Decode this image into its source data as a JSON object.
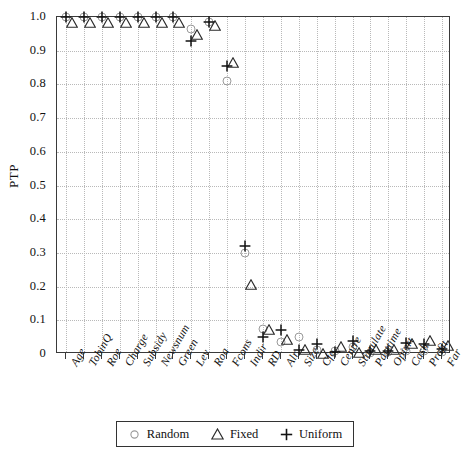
{
  "chart_data": {
    "type": "scatter",
    "title": "",
    "xlabel": "",
    "ylabel": "PTP",
    "ylim": [
      0,
      1.0
    ],
    "ytick_labels": [
      "1.0",
      "0.9",
      "0.8",
      "0.7",
      "0.6",
      "0.5",
      "0.4",
      "0.3",
      "0.2",
      "0.1",
      "0"
    ],
    "ytick_values": [
      1.0,
      0.9,
      0.8,
      0.7,
      0.6,
      0.5,
      0.4,
      0.3,
      0.2,
      0.1,
      0
    ],
    "grid": true,
    "legend_position": "below-axis",
    "categories": [
      "Age",
      "TobinQ",
      "Roe",
      "Charge",
      "Subsidy",
      "Newsnum",
      "Green",
      "Lev",
      "Roa",
      "Fcons",
      "Indir",
      "RD",
      "Alr",
      "Size",
      "Cfo",
      "Centre",
      "Stimulate",
      "Parttime",
      "Opicrt",
      "Cash",
      "Profit",
      "Far"
    ],
    "series": [
      {
        "name": "Random",
        "marker": "circle",
        "color": "#9a9a9a",
        "values": [
          1.0,
          1.0,
          1.0,
          1.0,
          1.0,
          1.0,
          1.0,
          0.965,
          0.985,
          0.81,
          0.3,
          0.075,
          0.035,
          0.05,
          0.012,
          0.008,
          0.02,
          0.004,
          0.006,
          0.01,
          0.008,
          0.005
        ]
      },
      {
        "name": "Fixed",
        "marker": "triangle",
        "color": "#2b2b2b",
        "values": [
          1.0,
          1.0,
          1.0,
          1.0,
          1.0,
          1.0,
          1.0,
          0.965,
          0.99,
          0.88,
          0.222,
          0.09,
          0.058,
          0.03,
          0.018,
          0.04,
          0.022,
          0.03,
          0.03,
          0.048,
          0.055,
          0.042
        ]
      },
      {
        "name": "Uniform",
        "marker": "plus",
        "color": "#111111",
        "values": [
          1.0,
          1.0,
          1.0,
          1.0,
          1.0,
          1.0,
          1.0,
          0.928,
          0.985,
          0.855,
          0.32,
          0.05,
          0.07,
          0.012,
          0.03,
          0.006,
          0.038,
          0.01,
          0.01,
          0.032,
          0.03,
          0.016
        ]
      }
    ]
  },
  "legend": {
    "items": [
      {
        "label": "Random",
        "symbol": "circle-icon"
      },
      {
        "label": "Fixed",
        "symbol": "triangle-icon"
      },
      {
        "label": "Uniform",
        "symbol": "plus-icon"
      }
    ]
  }
}
